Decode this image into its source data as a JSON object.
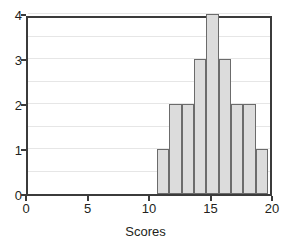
{
  "chart_data": {
    "type": "bar",
    "title": "",
    "subtitle": "",
    "xlabel": "Scores",
    "ylabel": "",
    "xlim": [
      0,
      20
    ],
    "ylim": [
      0,
      4
    ],
    "grid": true,
    "legend": null,
    "legend_position": "none",
    "bin_width": 1,
    "x_ticks": [
      0,
      5,
      10,
      15,
      20
    ],
    "x_tick_labels": [
      "0",
      "5",
      "10",
      "15",
      "20"
    ],
    "y_ticks": [
      0,
      1,
      2,
      3,
      4
    ],
    "y_tick_labels": [
      "0",
      "1",
      "2",
      "3",
      "4"
    ],
    "y_gridlines": [
      0.5,
      1.0,
      1.5,
      2.0,
      2.5,
      3.0,
      3.5,
      4.0
    ],
    "bins": [
      {
        "start": 10.5,
        "end": 11.5,
        "center": 11,
        "value": 1
      },
      {
        "start": 11.5,
        "end": 12.5,
        "center": 12,
        "value": 2
      },
      {
        "start": 12.5,
        "end": 13.5,
        "center": 13,
        "value": 2
      },
      {
        "start": 13.5,
        "end": 14.5,
        "center": 14,
        "value": 3
      },
      {
        "start": 14.5,
        "end": 15.5,
        "center": 15,
        "value": 4
      },
      {
        "start": 15.5,
        "end": 16.5,
        "center": 16,
        "value": 3
      },
      {
        "start": 16.5,
        "end": 17.5,
        "center": 17,
        "value": 2
      },
      {
        "start": 17.5,
        "end": 18.5,
        "center": 18,
        "value": 2
      },
      {
        "start": 18.5,
        "end": 19.5,
        "center": 19,
        "value": 1
      }
    ],
    "categories": [
      "10.5-11.5",
      "11.5-12.5",
      "12.5-13.5",
      "13.5-14.5",
      "14.5-15.5",
      "15.5-16.5",
      "16.5-17.5",
      "17.5-18.5",
      "18.5-19.5"
    ],
    "values": [
      1,
      2,
      2,
      3,
      4,
      3,
      2,
      2,
      1
    ],
    "colors": {
      "bar_fill": "#dcdcdc",
      "bar_stroke": "#6b6b6b",
      "axis": "#3b3b3b",
      "gridline": "#e6e6e6",
      "text": "#231f20",
      "background": "#ffffff"
    }
  }
}
